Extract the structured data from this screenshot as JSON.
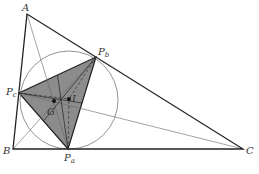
{
  "diagram": {
    "type": "triangle-geometry",
    "colors": {
      "stroke": "#222222",
      "thin_stroke": "#666666",
      "circle": "#777777",
      "fill": "#8c8c8c",
      "point": "#111111"
    },
    "points": {
      "A": {
        "label": "A",
        "x": 27,
        "y": 14
      },
      "B": {
        "label": "B",
        "x": 13,
        "y": 149
      },
      "C": {
        "label": "C",
        "x": 243,
        "y": 149
      },
      "Pa": {
        "label": "P",
        "sub": "a",
        "x": 68,
        "y": 149
      },
      "Pb": {
        "label": "P",
        "sub": "b",
        "x": 96,
        "y": 57
      },
      "Pc": {
        "label": "P",
        "sub": "c",
        "x": 19,
        "y": 93
      },
      "G": {
        "label": "G",
        "x": 54,
        "y": 101
      },
      "I": {
        "label": "I",
        "x": 69,
        "y": 99
      }
    },
    "incircle": {
      "cx": 69,
      "cy": 100,
      "r": 49
    },
    "labels": {
      "A": "A",
      "B": "B",
      "C": "C",
      "P": "P",
      "a": "a",
      "b": "b",
      "c": "c",
      "G": "G",
      "I": "I"
    }
  }
}
